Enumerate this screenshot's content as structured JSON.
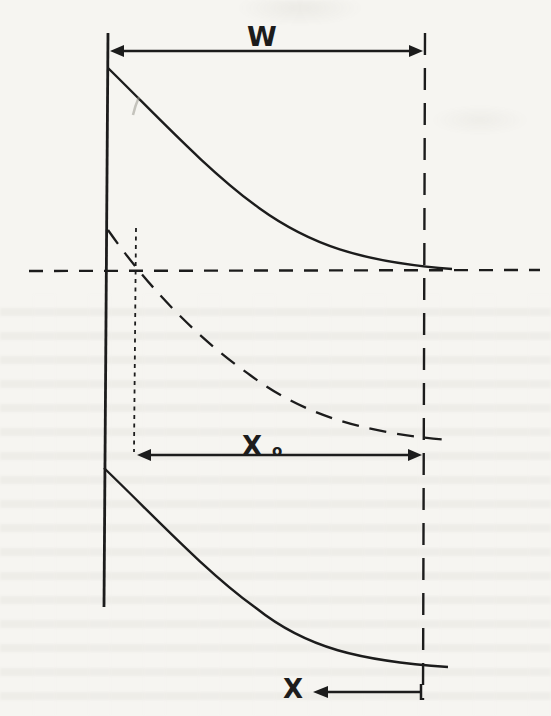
{
  "figure": {
    "kind": "band-bending-depletion-diagram",
    "colors": {
      "paper": "#f6f5f1",
      "ink": "#1c1c1c",
      "pencil_mark": "#9a998f"
    }
  },
  "annotations": {
    "w_dimension": {
      "label": "W",
      "arrow": "double-headed"
    },
    "x0_dimension": {
      "label": "X",
      "subscript": "o",
      "arrow": "double-headed"
    },
    "x_axis": {
      "label": "X",
      "arrow": "left"
    }
  }
}
